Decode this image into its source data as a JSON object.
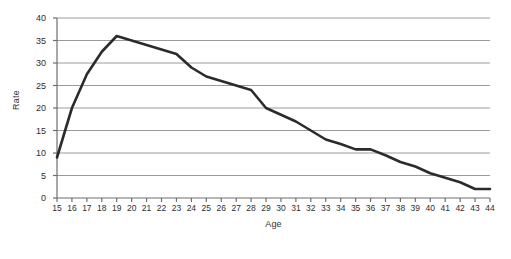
{
  "figure": {
    "background": "#ffffff",
    "caption": ""
  },
  "chart_data": {
    "type": "line",
    "title": "",
    "xlabel": "Age",
    "ylabel": "Rate",
    "xlim": [
      15,
      44
    ],
    "ylim": [
      0,
      40
    ],
    "grid": "horizontal",
    "legend": "none",
    "line_color": "#2b2b2b",
    "line_width": 2.6,
    "axis_color": "#6e6e6e",
    "gridline_color": "#9a9a9a",
    "yticks": [
      0,
      5,
      10,
      15,
      20,
      25,
      30,
      35,
      40
    ],
    "ytick_labels": [
      "0",
      "5",
      "10",
      "15",
      "20",
      "25",
      "30",
      "35",
      "40"
    ],
    "xticks": [
      15,
      16,
      17,
      18,
      19,
      20,
      21,
      22,
      23,
      24,
      25,
      26,
      27,
      28,
      29,
      30,
      31,
      32,
      33,
      34,
      35,
      36,
      37,
      38,
      39,
      40,
      41,
      42,
      43,
      44
    ],
    "xtick_labels": [
      "15",
      "16",
      "17",
      "18",
      "19",
      "20",
      "21",
      "22",
      "23",
      "24",
      "25",
      "26",
      "27",
      "28",
      "29",
      "30",
      "31",
      "32",
      "33",
      "34",
      "35",
      "36",
      "37",
      "38",
      "39",
      "40",
      "41",
      "42",
      "43",
      "44"
    ],
    "categories": [
      15,
      16,
      17,
      18,
      19,
      20,
      21,
      22,
      23,
      24,
      25,
      26,
      27,
      28,
      29,
      30,
      31,
      32,
      33,
      34,
      35,
      36,
      37,
      38,
      39,
      40,
      41,
      42,
      43,
      44
    ],
    "values": [
      9.0,
      20.0,
      27.5,
      32.5,
      36.0,
      35.0,
      34.0,
      33.0,
      32.0,
      29.0,
      27.0,
      26.0,
      25.0,
      24.0,
      20.0,
      18.5,
      17.0,
      15.0,
      13.0,
      12.0,
      10.8,
      10.8,
      9.5,
      8.0,
      7.0,
      5.5,
      4.5,
      3.5,
      2.0,
      2.0
    ],
    "series": [
      {
        "name": "Rate by age",
        "values": [
          9.0,
          20.0,
          27.5,
          32.5,
          36.0,
          35.0,
          34.0,
          33.0,
          32.0,
          29.0,
          27.0,
          26.0,
          25.0,
          24.0,
          20.0,
          18.5,
          17.0,
          15.0,
          13.0,
          12.0,
          10.8,
          10.8,
          9.5,
          8.0,
          7.0,
          5.5,
          4.5,
          3.5,
          2.0,
          2.0
        ]
      }
    ]
  }
}
